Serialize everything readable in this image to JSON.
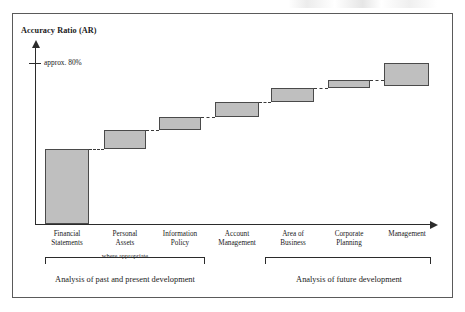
{
  "figure": {
    "y_axis_title": "Accuracy Ratio (AR)",
    "y_tick_label": "approx. 80%",
    "note_where_appropriate": "where appropriate",
    "group_left_caption": "Analysis of past and present development",
    "group_right_caption": "Analysis of future development"
  },
  "chart_data": {
    "type": "bar",
    "title": "",
    "subtitle": "",
    "xlabel": "",
    "ylabel": "Accuracy Ratio (AR)",
    "grid": false,
    "legend": "none",
    "style": "waterfall-step-chart",
    "annotations": [
      {
        "text": "approx. 80%",
        "axis": "y",
        "value": 80
      },
      {
        "text": "where appropriate",
        "spans_categories": [
          "Financial Statements",
          "Personal Assets",
          "Information Policy",
          "Account Management"
        ]
      }
    ],
    "categories": [
      "Financial Statements",
      "Personal Assets",
      "Information Policy",
      "Account Management",
      "Area of Business",
      "Corporate Planning",
      "Management"
    ],
    "category_labels_wrapped": [
      [
        "Financial",
        "Statements"
      ],
      [
        "Personal",
        "Assets"
      ],
      [
        "Information",
        "Policy"
      ],
      [
        "Account",
        "Management"
      ],
      [
        "Area of",
        "Business"
      ],
      [
        "Corporate",
        "Planning"
      ],
      [
        "Management"
      ]
    ],
    "cumulative_start": [
      0,
      35,
      47,
      54,
      64,
      72,
      76
    ],
    "cumulative_end": [
      35,
      47,
      54,
      64,
      72,
      76,
      89
    ],
    "values": [
      35,
      12,
      7,
      10,
      8,
      4,
      13
    ],
    "ylim": [
      0,
      100
    ],
    "groups": [
      {
        "label": "Analysis of past and present development",
        "categories": [
          "Financial Statements",
          "Personal Assets",
          "Information Policy",
          "Account Management"
        ]
      },
      {
        "label": "Analysis of future development",
        "categories": [
          "Area of Business",
          "Corporate Planning",
          "Management"
        ]
      }
    ]
  },
  "geometry": {
    "bars": [
      {
        "left": 32,
        "top": 135,
        "width": 44,
        "height": 75
      },
      {
        "left": 91,
        "top": 116,
        "width": 42,
        "height": 19
      },
      {
        "left": 146,
        "top": 103,
        "width": 42,
        "height": 13
      },
      {
        "left": 202,
        "top": 88,
        "width": 44,
        "height": 15
      },
      {
        "left": 258,
        "top": 74,
        "width": 43,
        "height": 14
      },
      {
        "left": 315,
        "top": 66,
        "width": 42,
        "height": 8
      },
      {
        "left": 371,
        "top": 49,
        "width": 45,
        "height": 23
      }
    ],
    "connectors": [
      {
        "left": 76,
        "top": 135,
        "width": 15
      },
      {
        "left": 133,
        "top": 116,
        "width": 13
      },
      {
        "left": 188,
        "top": 103,
        "width": 14
      },
      {
        "left": 246,
        "top": 88,
        "width": 12
      },
      {
        "left": 301,
        "top": 74,
        "width": 14
      },
      {
        "left": 357,
        "top": 66,
        "width": 14
      }
    ],
    "cat_label_positions": [
      {
        "left": 22,
        "width": 64
      },
      {
        "left": 80,
        "width": 64
      },
      {
        "left": 135,
        "width": 64
      },
      {
        "left": 190,
        "width": 68
      },
      {
        "left": 248,
        "width": 64
      },
      {
        "left": 304,
        "width": 64
      },
      {
        "left": 360,
        "width": 68
      }
    ],
    "brackets": [
      {
        "left": 32,
        "width": 160
      },
      {
        "left": 252,
        "width": 166
      }
    ],
    "group_captions": [
      {
        "left": 22,
        "width": 180
      },
      {
        "left": 248,
        "width": 176
      }
    ]
  }
}
